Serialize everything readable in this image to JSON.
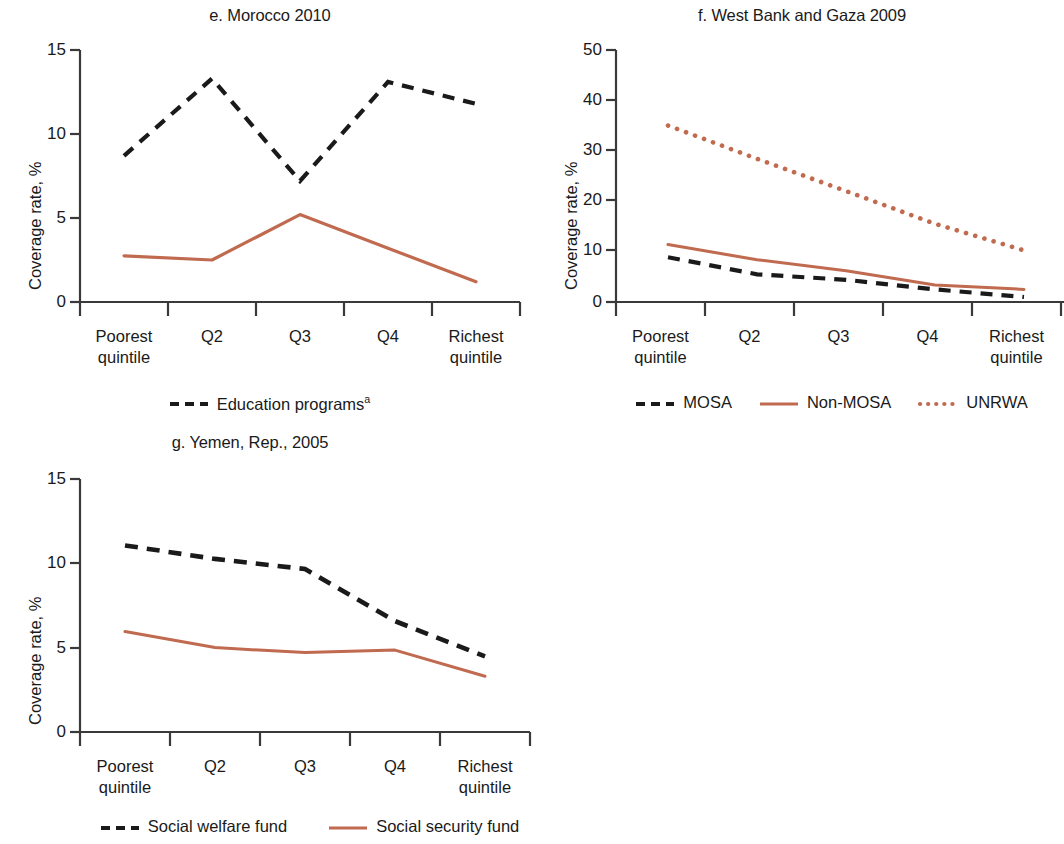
{
  "colors": {
    "dark": "#1a1a1a",
    "red": "#C06A4F",
    "axis": "#3a3a3a",
    "background": "#ffffff"
  },
  "panels": [
    {
      "id": "morocco",
      "title": "e. Morocco 2010",
      "ylabel": "Coverage rate, %",
      "legend": [
        {
          "label": "Education programs",
          "sup": "a",
          "style": "dashed",
          "color": "#1a1a1a"
        }
      ]
    },
    {
      "id": "west-bank-gaza",
      "title": "f. West Bank and Gaza 2009",
      "ylabel": "Coverage rate, %",
      "legend": [
        {
          "label": "MOSA",
          "sup": "",
          "style": "dashed",
          "color": "#1a1a1a"
        },
        {
          "label": "Non-MOSA",
          "sup": "",
          "style": "solid",
          "color": "#C06A4F"
        },
        {
          "label": "UNRWA",
          "sup": "",
          "style": "dotted",
          "color": "#C06A4F"
        }
      ]
    },
    {
      "id": "yemen",
      "title": "g. Yemen, Rep., 2005",
      "ylabel": "Coverage rate, %",
      "legend": [
        {
          "label": "Social welfare fund",
          "sup": "",
          "style": "dashed",
          "color": "#1a1a1a"
        },
        {
          "label": "Social security fund",
          "sup": "",
          "style": "solid",
          "color": "#C06A4F"
        }
      ]
    }
  ],
  "chart_data": [
    {
      "type": "line",
      "title": "e. Morocco 2010",
      "xlabel": "",
      "ylabel": "Coverage rate, %",
      "categories": [
        "Poorest quintile",
        "Q2",
        "Q3",
        "Q4",
        "Richest quintile"
      ],
      "ylim": [
        0,
        15
      ],
      "yticks": [
        0,
        5,
        10,
        15
      ],
      "grid": false,
      "legend_position": "bottom",
      "series": [
        {
          "name": "Education programs",
          "style": "dashed",
          "color": "#1a1a1a",
          "values": [
            8.7,
            13.3,
            7.2,
            13.1,
            11.8
          ]
        },
        {
          "name": "Unlabeled red series",
          "style": "solid",
          "color": "#C06A4F",
          "values": [
            2.75,
            2.5,
            5.2,
            3.2,
            1.2
          ]
        }
      ]
    },
    {
      "type": "line",
      "title": "f. West Bank and Gaza 2009",
      "xlabel": "",
      "ylabel": "Coverage rate, %",
      "categories": [
        "Poorest quintile",
        "Q2",
        "Q3",
        "Q4",
        "Richest quintile"
      ],
      "ylim": [
        0,
        50
      ],
      "yticks": [
        0,
        10,
        20,
        30,
        40,
        50
      ],
      "grid": false,
      "legend_position": "bottom",
      "series": [
        {
          "name": "MOSA",
          "style": "dashed",
          "color": "#1a1a1a",
          "values": [
            8.9,
            5.5,
            4.4,
            2.5,
            1.0
          ]
        },
        {
          "name": "Non-MOSA",
          "style": "solid",
          "color": "#C06A4F",
          "values": [
            11.4,
            8.4,
            6.2,
            3.4,
            2.5
          ]
        },
        {
          "name": "UNRWA",
          "style": "dotted",
          "color": "#C06A4F",
          "values": [
            35.0,
            28.5,
            22.0,
            15.5,
            10.2
          ]
        }
      ]
    },
    {
      "type": "line",
      "title": "g. Yemen, Rep., 2005",
      "xlabel": "",
      "ylabel": "Coverage rate, %",
      "categories": [
        "Poorest quintile",
        "Q2",
        "Q3",
        "Q4",
        "Richest quintile"
      ],
      "ylim": [
        0,
        15
      ],
      "yticks": [
        0,
        5,
        10,
        15
      ],
      "grid": false,
      "legend_position": "bottom",
      "series": [
        {
          "name": "Social welfare fund",
          "style": "dashed",
          "color": "#1a1a1a",
          "values": [
            11.1,
            10.3,
            9.7,
            6.6,
            4.5
          ]
        },
        {
          "name": "Social security fund",
          "style": "solid",
          "color": "#C06A4F",
          "values": [
            5.95,
            5.0,
            4.7,
            4.85,
            3.3
          ]
        }
      ]
    }
  ]
}
